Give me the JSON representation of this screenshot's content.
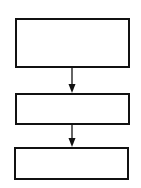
{
  "diagram": {
    "type": "flowchart",
    "direction": "top-to-bottom",
    "stroke_color": "#111111",
    "background": "#ffffff",
    "nodes": [
      {
        "id": "box-1",
        "label": "",
        "x": 15,
        "y": 18,
        "w": 115,
        "h": 50
      },
      {
        "id": "box-2",
        "label": "",
        "x": 15,
        "y": 93,
        "w": 115,
        "h": 32
      },
      {
        "id": "box-3",
        "label": "",
        "x": 14,
        "y": 147,
        "w": 115,
        "h": 33
      }
    ],
    "edges": [
      {
        "from": "box-1",
        "to": "box-2"
      },
      {
        "from": "box-2",
        "to": "box-3"
      }
    ]
  }
}
